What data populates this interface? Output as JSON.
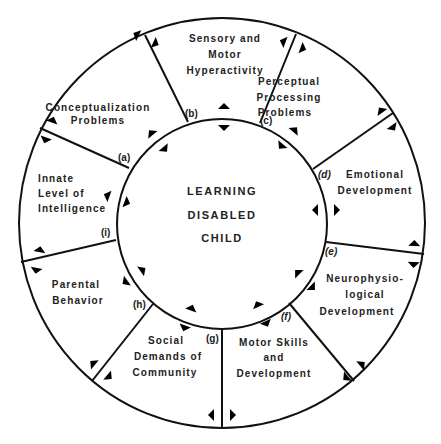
{
  "diagram": {
    "center": {
      "lines": [
        "LEARNING",
        "DISABLED",
        "CHILD"
      ]
    },
    "segments": [
      {
        "id": "a",
        "tag": "(a)",
        "lines": [
          "Conceptualization",
          "Problems"
        ]
      },
      {
        "id": "b",
        "tag": "(b)",
        "lines": [
          "Sensory and",
          "Motor",
          "Hyperactivity"
        ]
      },
      {
        "id": "c",
        "tag": "(c)",
        "lines": [
          "Perceptual",
          "Processing",
          "Problems"
        ]
      },
      {
        "id": "d",
        "tag": "(d)",
        "lines": [
          "Emotional",
          "Development"
        ]
      },
      {
        "id": "e",
        "tag": "(e)",
        "lines": [
          "Neurophysio-",
          "logical",
          "Development"
        ]
      },
      {
        "id": "f",
        "tag": "(f)",
        "lines": [
          "Motor Skills",
          "and",
          "Development"
        ]
      },
      {
        "id": "g",
        "tag": "(g)",
        "lines": [
          "Social",
          "Demands of",
          "Community"
        ]
      },
      {
        "id": "h",
        "tag": "(h)",
        "lines": [
          "Parental",
          "Behavior"
        ]
      },
      {
        "id": "i",
        "tag": "(i)",
        "lines": [
          "Innate",
          "Level of",
          "Intelligence"
        ]
      }
    ],
    "colors": {
      "stroke": "#111111",
      "text": "#222222",
      "background": "#ffffff"
    }
  }
}
